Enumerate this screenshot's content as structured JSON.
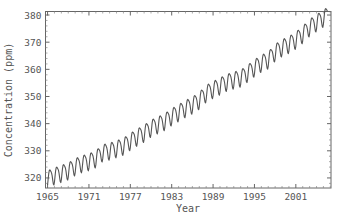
{
  "chart_data": {
    "type": "line",
    "title": "",
    "xlabel": "Year",
    "ylabel": "Concentration (ppm)",
    "xlim": [
      1964.7,
      2006.1
    ],
    "ylim": [
      316.3,
      381.3
    ],
    "grid": false,
    "legend": null,
    "x_ticks": [
      1965,
      1971,
      1977,
      1983,
      1989,
      1995,
      2001
    ],
    "x_tick_labels": [
      "1965",
      "1971",
      "1977",
      "1983",
      "1989",
      "1995",
      "2001"
    ],
    "y_ticks": [
      320,
      330,
      340,
      350,
      360,
      370,
      380
    ],
    "y_tick_labels": [
      "320",
      "330",
      "340",
      "350",
      "360",
      "370",
      "380"
    ],
    "line_color": "#555555",
    "series": [
      {
        "name": "CO2 concentration",
        "note": "monthly values with ~±3 ppm seasonal cycle around annual means",
        "x": [
          1965,
          1966,
          1967,
          1968,
          1969,
          1970,
          1971,
          1972,
          1973,
          1974,
          1975,
          1976,
          1977,
          1978,
          1979,
          1980,
          1981,
          1982,
          1983,
          1984,
          1985,
          1986,
          1987,
          1988,
          1989,
          1990,
          1991,
          1992,
          1993,
          1994,
          1995,
          1996,
          1997,
          1998,
          1999,
          2000,
          2001,
          2002,
          2003,
          2004
        ],
        "values": [
          320.0,
          321.1,
          322.0,
          322.9,
          324.5,
          325.6,
          326.3,
          327.4,
          329.7,
          330.2,
          331.1,
          332.0,
          333.8,
          335.4,
          336.8,
          338.7,
          339.9,
          341.1,
          342.9,
          344.4,
          345.9,
          347.2,
          348.9,
          351.5,
          352.9,
          354.2,
          355.6,
          356.4,
          357.1,
          358.9,
          360.9,
          362.6,
          363.8,
          366.6,
          368.3,
          369.5,
          371.1,
          373.2,
          375.8,
          377.5
        ]
      }
    ]
  }
}
